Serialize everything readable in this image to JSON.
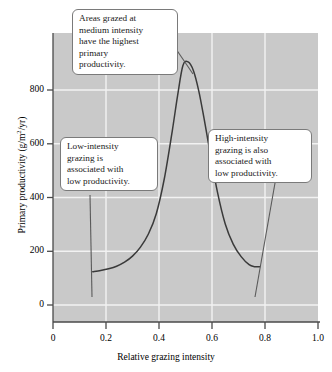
{
  "chart_data": {
    "type": "line",
    "title": "",
    "xlabel": "Relative grazing intensity",
    "ylabel": "Primary productivity (g/m²/yr)",
    "ylabel_prefix": "Primary productivity (g/m",
    "ylabel_exponent": "2",
    "ylabel_suffix": "/yr)",
    "xlim": [
      0,
      1.0
    ],
    "ylim": [
      -200,
      950
    ],
    "grid": true,
    "legend": "none",
    "xticks": [
      "0",
      "0.2",
      "0.4",
      "0.6",
      "0.8",
      "1.0"
    ],
    "xtick_values": [
      0,
      0.2,
      0.4,
      0.6,
      0.8,
      1.0
    ],
    "yticks": [
      "0",
      "200",
      "400",
      "600",
      "800"
    ],
    "ytick_values": [
      0,
      200,
      400,
      600,
      800
    ],
    "series": [
      {
        "name": "Primary productivity vs grazing intensity",
        "color": "#3a3a3a",
        "x": [
          0.15,
          0.18,
          0.21,
          0.24,
          0.27,
          0.3,
          0.33,
          0.36,
          0.39,
          0.42,
          0.45,
          0.47,
          0.49,
          0.51,
          0.53,
          0.55,
          0.57,
          0.59,
          0.62,
          0.65,
          0.68,
          0.71,
          0.74,
          0.76,
          0.78
        ],
        "y": [
          0,
          5,
          12,
          22,
          38,
          62,
          98,
          150,
          232,
          370,
          560,
          700,
          820,
          835,
          800,
          720,
          610,
          490,
          320,
          190,
          110,
          60,
          28,
          20,
          20
        ]
      }
    ],
    "plot_background": "#c9c9c9",
    "gridline_color": "#f0f0f0",
    "annotations": [
      {
        "name": "peak-callout",
        "lines": [
          "Areas grazed at",
          "medium intensity",
          "have the highest",
          "primary",
          "productivity."
        ],
        "points_to": {
          "x": 0.49,
          "y": 835
        }
      },
      {
        "name": "low-intensity-callout",
        "lines": [
          "Low-intensity",
          "grazing is",
          "associated with",
          "low productivity."
        ],
        "points_to": {
          "x": 0.15,
          "y": 0
        }
      },
      {
        "name": "high-intensity-callout",
        "lines": [
          "High-intensity",
          "grazing is also",
          "associated with",
          "low productivity."
        ],
        "points_to": {
          "x": 0.78,
          "y": 20
        }
      }
    ]
  }
}
